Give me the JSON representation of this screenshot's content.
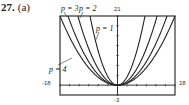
{
  "problem": {
    "number": "27.",
    "part": "(a)"
  },
  "chart_data": {
    "type": "line",
    "title": "",
    "xlabel": "",
    "ylabel": "",
    "xlim": [
      -18,
      18
    ],
    "ylim": [
      -3,
      21
    ],
    "grid": false,
    "axis_labels": {
      "xmin": "-18",
      "xmax": "18",
      "ymin": "-3",
      "ymax": "21"
    },
    "x_ticks_every": 3,
    "y_ticks_every": 3,
    "series": [
      {
        "name": "p = 1",
        "label": "p = 1",
        "top_crossing_x": 8.6
      },
      {
        "name": "p = 2",
        "label": "p = 2",
        "top_crossing_x": 12.4
      },
      {
        "name": "p = 3",
        "label": "p = 3",
        "top_crossing_x": 15.5
      },
      {
        "name": "p = 4",
        "label": "p = 4",
        "top_crossing_x": 18.0
      }
    ],
    "legend": "inline labels with leader lines"
  },
  "labels": {
    "p3": "p = 3",
    "p2": "p = 2",
    "p1": "p = 1",
    "p4": "p = 4",
    "xmin": "-18",
    "xmax": "18",
    "ymax": "21",
    "ymin": "-3"
  }
}
